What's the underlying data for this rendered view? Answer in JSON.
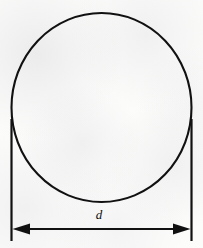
{
  "figure": {
    "background_color": "#fcfcfb",
    "ink_color": "#111111",
    "width": 203,
    "height": 248
  },
  "shapes": {
    "circle": {
      "name": "circle-outline",
      "center_x": 101.5,
      "center_y": 107.5,
      "radius_x": 90,
      "radius_y": 94.5,
      "stroke_width": 2.1,
      "fill": "none"
    },
    "extension_line_left": {
      "name": "extension-line-left",
      "x": 11.5,
      "y_top": 119,
      "y_bottom": 241,
      "stroke_width": 2.2
    },
    "extension_line_right": {
      "name": "extension-line-right",
      "x": 191.5,
      "y_top": 119,
      "y_bottom": 241,
      "stroke_width": 2.2
    },
    "dimension_line": {
      "name": "diameter-dimension-line",
      "y": 229,
      "x_start": 12,
      "x_end": 191,
      "stroke_width": 2.2,
      "arrowheads": "both",
      "arrow_length": 17,
      "arrow_half_width": 5.5
    }
  },
  "labels": {
    "diameter": {
      "text": "d",
      "x": 99,
      "y": 214,
      "style": "italic"
    }
  }
}
